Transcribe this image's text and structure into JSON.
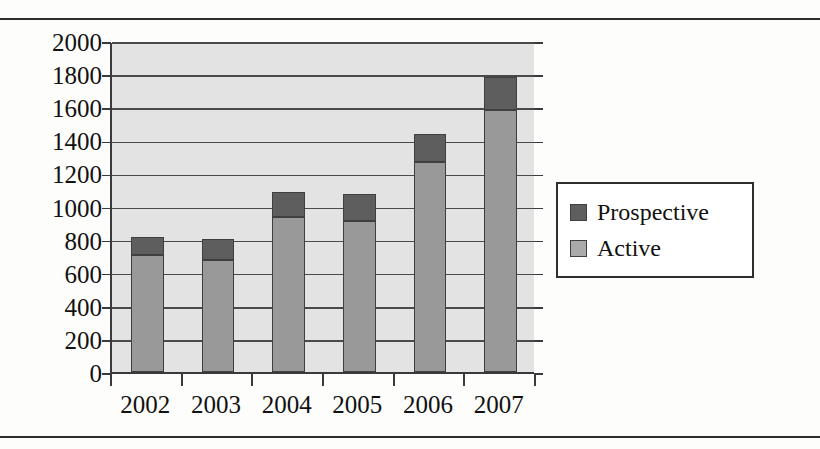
{
  "chart_data": {
    "type": "bar",
    "subtype": "stacked-vertical",
    "title": "",
    "xlabel": "",
    "ylabel": "",
    "categories": [
      "2002",
      "2003",
      "2004",
      "2005",
      "2006",
      "2007"
    ],
    "series": [
      {
        "name": "Active",
        "color": "#999999",
        "values": [
          710,
          675,
          935,
          910,
          1270,
          1585
        ]
      },
      {
        "name": "Prospective",
        "color": "#5e5e5e",
        "values": [
          105,
          130,
          155,
          165,
          170,
          195
        ]
      }
    ],
    "totals": [
      815,
      805,
      1090,
      1075,
      1440,
      1780
    ],
    "ylim": [
      0,
      2000
    ],
    "ytick_step": 200,
    "yticks": [
      "2000",
      "1800",
      "1600",
      "1400",
      "1200",
      "1000",
      "800",
      "600",
      "400",
      "200",
      "0"
    ],
    "grid": "horizontal",
    "legend_position": "right",
    "plot_background": "#e3e3e3",
    "axis_color": "#3a3a3a"
  },
  "legend": {
    "entries": [
      {
        "label": "Prospective",
        "swatch": "prospective"
      },
      {
        "label": "Active",
        "swatch": "active"
      }
    ]
  }
}
